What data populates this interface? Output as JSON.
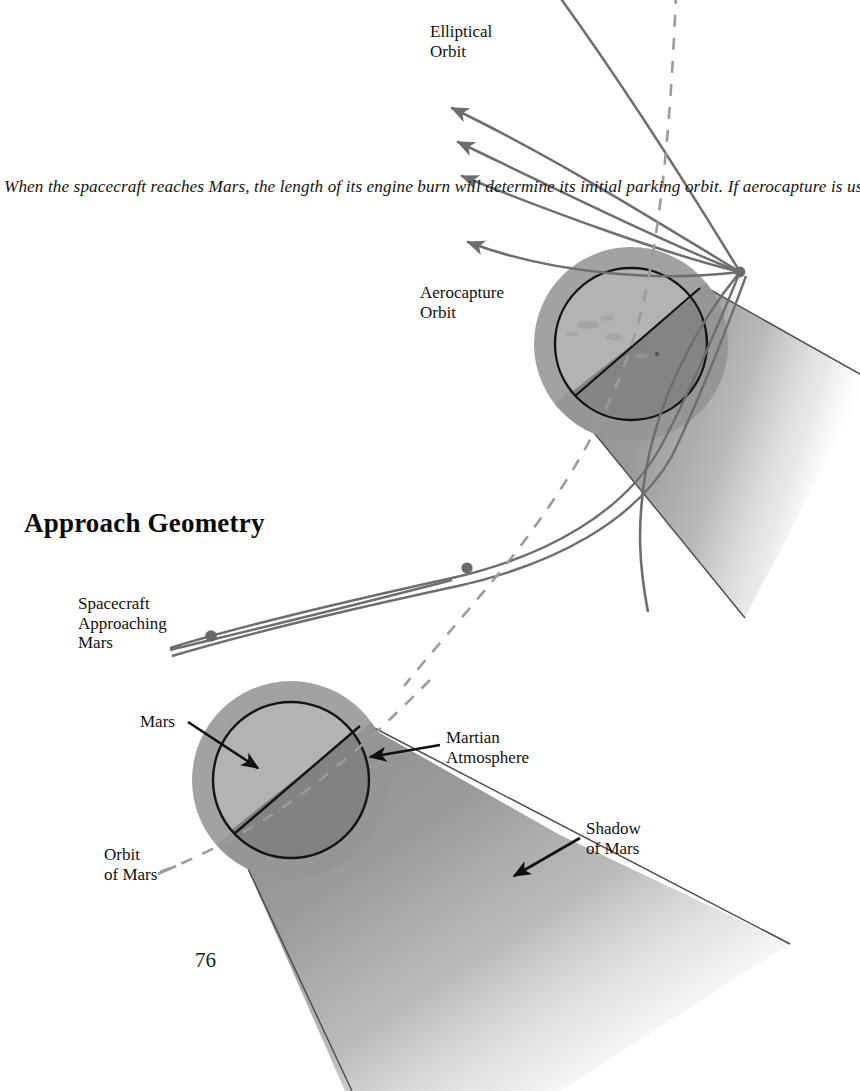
{
  "page": {
    "number": "76",
    "heading": "Approach Geometry",
    "caption": "When the spacecraft reaches Mars, the length of its engine burn will determine its initial parking orbit. If aerocapture is used, the craft will dive into the Martian atmosphere to lose speed. A variety of elliptical capture orbits is shown: the longer the burn, the lower the high point. A flyby is achieved by a minimal firing of the engines to return the spacecraft to the Earth."
  },
  "labels": {
    "elliptical_orbit": "Elliptical\nOrbit",
    "aerocapture_orbit": "Aerocapture\nOrbit",
    "spacecraft_approaching_mars": "Spacecraft\nApproaching\nMars",
    "mars": "Mars",
    "martian_atmosphere": "Martian\nAtmosphere",
    "shadow_of_mars": "Shadow\nof Mars",
    "orbit_of_mars": "Orbit\nof Mars"
  },
  "colors": {
    "ink": "#111111",
    "trajectory_gray": "#6e6e6e",
    "dashed_orbit_gray": "#9a9a9a",
    "planet_lit": "#b1b1b1",
    "planet_dark": "#7c7c7c",
    "atmosphere_ring": "#a0a0a0",
    "shadow_cone": "#9d9d9d",
    "background": "#ffffff"
  },
  "diagram": {
    "type": "orbital-approach-geometry",
    "upper_scene": {
      "planet_center_x": 631,
      "planet_center_y": 344,
      "planet_radius": 76,
      "atmosphere_radius": 97,
      "terminator_angle_deg": -38,
      "capture_point_x": 740,
      "capture_point_y": 272,
      "elliptical_arrow_count": 5
    },
    "lower_scene": {
      "planet_center_x": 291,
      "planet_center_y": 780,
      "planet_radius": 78,
      "atmosphere_radius": 99,
      "terminator_angle_deg": -38
    },
    "spacecraft_marker_x": 211,
    "spacecraft_marker_y": 636,
    "midcourse_marker_x": 467,
    "midcourse_marker_y": 568
  }
}
